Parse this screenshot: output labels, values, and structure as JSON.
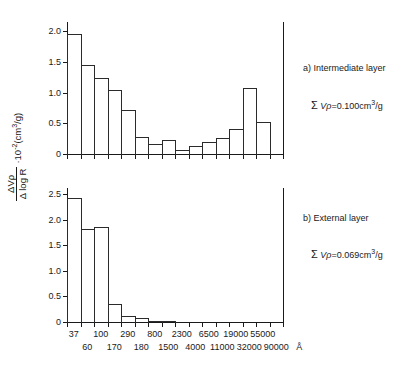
{
  "yaxis_caption": {
    "numerator": "ΔVρ",
    "denominator": "Δ log R",
    "multiplier": "·10",
    "exponent": "-2",
    "unit_open": "(cm",
    "unit_exp": "3",
    "unit_close": "/g)"
  },
  "panels": [
    {
      "id": "intermediate-layer",
      "label": "a) Intermediate layer",
      "sum_symbol": "Σ",
      "sum_variable": "V",
      "sum_variable_sub": "ρ",
      "sum_equals": "=",
      "sum_value": "0.100",
      "sum_unit_open": "cm",
      "sum_unit_exp": "3",
      "sum_unit_close": "/g",
      "yticks": [
        "0",
        "0.5",
        "1.0",
        "1.5",
        "2.0"
      ],
      "ytick_values": [
        0,
        0.5,
        1.0,
        1.5,
        2.0
      ],
      "ymax": 2.15
    },
    {
      "id": "external-layer",
      "label": "b) External layer",
      "sum_symbol": "Σ",
      "sum_variable": "V",
      "sum_variable_sub": "ρ",
      "sum_equals": "=",
      "sum_value": "0.069",
      "sum_unit_open": "cm",
      "sum_unit_exp": "3",
      "sum_unit_close": "/g",
      "yticks": [
        "0",
        "0.5",
        "1.0",
        "1.5",
        "2.0",
        "2.5"
      ],
      "ytick_values": [
        0,
        0.5,
        1.0,
        1.5,
        2.0,
        2.5
      ],
      "ymax": 2.62
    }
  ],
  "xaxis": {
    "unit": "Å",
    "labels_top_row": [
      "37",
      "100",
      "290",
      "800",
      "2300",
      "6500",
      "19000",
      "55000"
    ],
    "labels_bottom_row": [
      "60",
      "170",
      "180",
      "1500",
      "4000",
      "11000",
      "32000",
      "90000"
    ]
  },
  "chart_data": [
    {
      "type": "bar",
      "title": "a) Intermediate layer",
      "xlabel": "R (Å)",
      "ylabel": "ΔVρ/ΔlogR ·10⁻² (cm³/g)",
      "categories": [
        "37",
        "60",
        "100",
        "170",
        "290",
        "180",
        "800",
        "1500",
        "2300",
        "4000",
        "6500",
        "11000",
        "19000",
        "32000",
        "55000",
        "90000"
      ],
      "values": [
        1.96,
        1.45,
        1.23,
        1.05,
        0.72,
        0.27,
        0.17,
        0.22,
        0.07,
        0.13,
        0.2,
        0.26,
        0.4,
        1.07,
        0.52,
        0.0
      ],
      "ylim": [
        0,
        2.15
      ],
      "grid": false,
      "legend": "none",
      "annotation": "Σ Vρ = 0.100 cm³/g"
    },
    {
      "type": "bar",
      "title": "b) External layer",
      "xlabel": "R (Å)",
      "ylabel": "ΔVρ/ΔlogR ·10⁻² (cm³/g)",
      "categories": [
        "37",
        "60",
        "100",
        "170",
        "290",
        "180",
        "800",
        "1500",
        "2300",
        "4000",
        "6500",
        "11000",
        "19000",
        "32000",
        "55000",
        "90000"
      ],
      "values": [
        2.43,
        1.81,
        1.85,
        0.35,
        0.11,
        0.07,
        0.01,
        0.01,
        0.0,
        0.0,
        0.0,
        0.0,
        0.0,
        0.0,
        0.0,
        0.0
      ],
      "ylim": [
        0,
        2.62
      ],
      "grid": false,
      "legend": "none",
      "annotation": "Σ Vρ = 0.069 cm³/g"
    }
  ]
}
